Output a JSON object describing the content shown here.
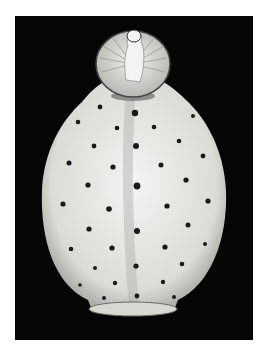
{
  "image": {
    "subject": "White porcelain snuff bottle with dark dots and scroll pattern",
    "background_color": "#050505",
    "border_color": "#ffffff",
    "body_color": "#e9e9e4",
    "dot_color": "#1a1a1a"
  }
}
